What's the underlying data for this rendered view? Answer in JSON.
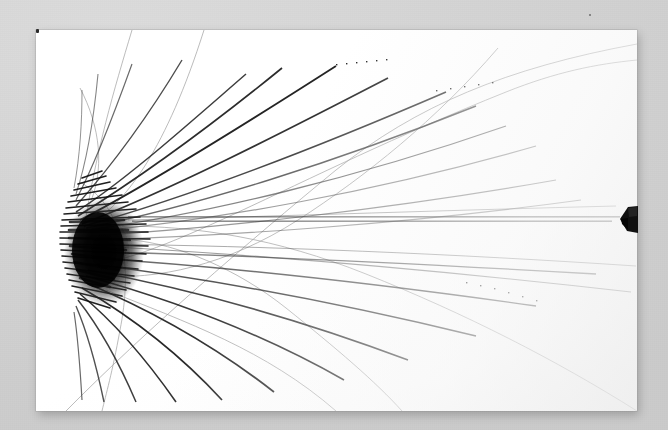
{
  "photo": {
    "subject": "printed radial network diagram poster photographed on a flat gray surface",
    "caption": "Large-format printed fan / radial network chart lying on a light gray table, photographed slightly off-axis",
    "backdrop_color": "#d6d6d6",
    "paper_color": "#ffffff",
    "ink_color": "#1a1a1a",
    "width_px": 668,
    "height_px": 430
  },
  "sheet": {
    "label": "printed poster sheet",
    "left_px": 36,
    "top_px": 30,
    "width_px": 601,
    "height_px": 381,
    "edge_note": "top edge bows gently downward toward the right; bottom edge rises slightly toward the right"
  },
  "diagram": {
    "kind": "radial fan / node-link network with micro-text labels",
    "hub": {
      "name": "label-cluster-hub",
      "center_x_px": 68,
      "center_y_px": 222,
      "radius_x_px": 38,
      "radius_y_px": 52,
      "density": "saturated black, individual labels unresolvable at this scale"
    },
    "rays": {
      "name": "radiating-label-lines",
      "count": 46,
      "description": "dotted / micro-typeset text strings radiating rightward from the hub, fanning roughly from -70 deg to +70 deg",
      "longest_reaches_px": 600
    },
    "curves": {
      "name": "sweeping-connector-curves",
      "count": 7,
      "description": "thin gray bezier arcs crossing the sheet, several leaving the fan and sweeping to the far right and bottom"
    },
    "banner_text_line": {
      "name": "horizontal-banner-text",
      "y_px": 220,
      "from_x_px": 128,
      "to_x_px": 620,
      "description": "one near-horizontal run of very small inverted type spanning most of the sheet width"
    }
  },
  "objects": [
    {
      "name": "edge-object",
      "description": "small dark wedge-shaped object resting against the right edge of the sheet",
      "x_px": 619,
      "y_px": 204,
      "width_px": 20,
      "height_px": 31,
      "color": "#111111"
    },
    {
      "name": "corner-mark",
      "description": "small dark mark just outside the top-left corner of the sheet",
      "x_px": 36,
      "y_px": 29,
      "color": "#2b2b2b"
    },
    {
      "name": "backdrop-speck",
      "description": "faint speck on the gray backdrop above the sheet",
      "x_px": 589,
      "y_px": 14,
      "color": "#6d6d6d"
    }
  ],
  "legibility": {
    "note": "All printed text on the poster is below the resolution of the photograph and cannot be transcribed."
  }
}
